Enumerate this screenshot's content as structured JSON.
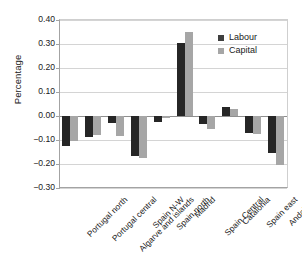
{
  "chart_data": {
    "type": "bar",
    "title": "",
    "xlabel": "",
    "ylabel": "Percentage",
    "ylim": [
      -0.3,
      0.4
    ],
    "ytick_step": 0.1,
    "yticks": [
      "0.40",
      "0.30",
      "0.20",
      "0.10",
      "0.00",
      "-0.10",
      "-0.20",
      "-0.30"
    ],
    "ytick_values": [
      0.4,
      0.3,
      0.2,
      0.1,
      0.0,
      -0.1,
      -0.2,
      -0.3
    ],
    "grid": true,
    "grid_axis": "y",
    "legend_position": "upper-right",
    "categories": [
      "Portugal north",
      "Portugal central",
      "Algarve and islands",
      "Spain N-W",
      "Spain north",
      "Madrid",
      "Spain Central",
      "Catalonia",
      "Spain east",
      "Andalucia"
    ],
    "series": [
      {
        "name": "Labour",
        "color": "#262626",
        "values": [
          -0.125,
          -0.088,
          -0.03,
          -0.165,
          -0.025,
          0.305,
          -0.032,
          0.037,
          -0.07,
          -0.155
        ]
      },
      {
        "name": "Capital",
        "color": "#a6a6a6",
        "values": [
          -0.105,
          -0.078,
          -0.085,
          -0.175,
          -0.01,
          0.352,
          -0.055,
          0.03,
          -0.075,
          -0.205
        ]
      }
    ]
  },
  "legend": {
    "items": [
      {
        "label": "Labour",
        "color": "#262626"
      },
      {
        "label": "Capital",
        "color": "#a6a6a6"
      }
    ]
  },
  "axis": {
    "y_title": "Percentage"
  }
}
